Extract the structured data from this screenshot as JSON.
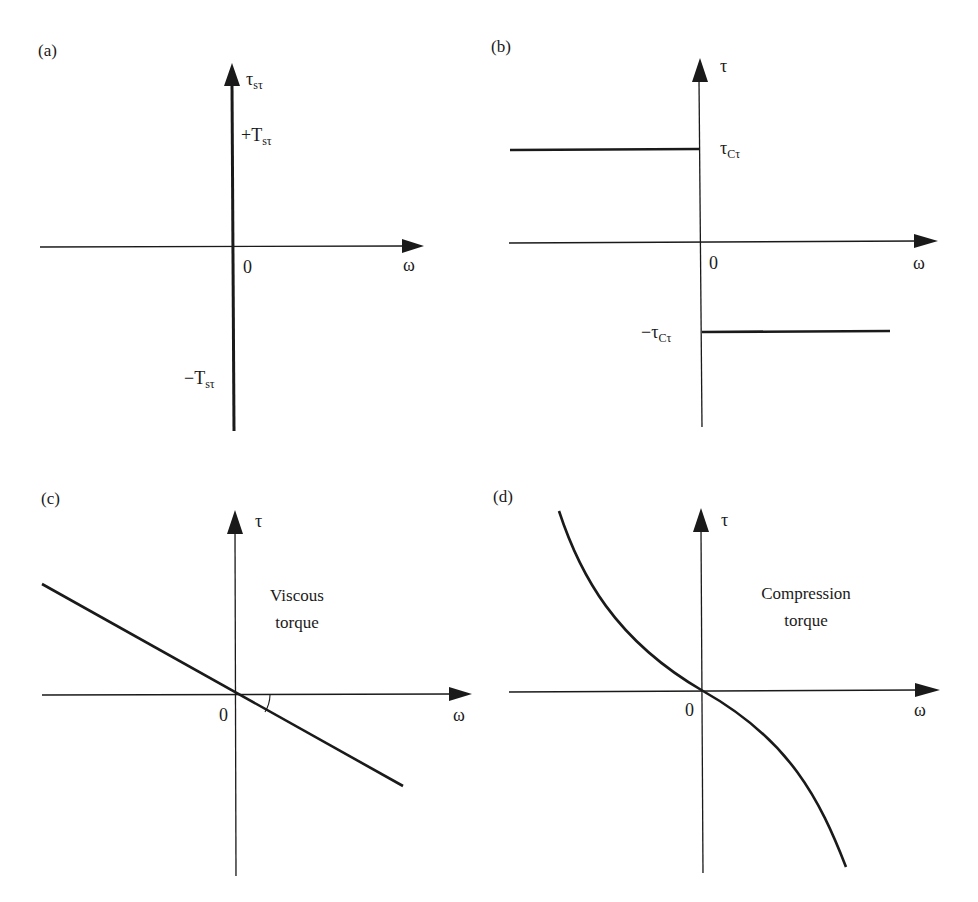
{
  "figure": {
    "panels": [
      {
        "id": "a",
        "label": "(a)",
        "y_axis_label": "τ",
        "y_axis_sub": "sτ",
        "x_axis_label": "ω",
        "origin_label": "0",
        "upper_level_label": "+T",
        "upper_level_sub": "sτ",
        "lower_level_label": "−T",
        "lower_level_sub": "sτ",
        "description": "Static friction torque: vertical segment along τ-axis at ω = 0 between −Tsτ and +Tsτ"
      },
      {
        "id": "b",
        "label": "(b)",
        "y_axis_label": "τ",
        "x_axis_label": "ω",
        "origin_label": "0",
        "upper_level_label": "τ",
        "upper_level_sub": "Cτ",
        "lower_level_label": "−τ",
        "lower_level_sub": "Cτ",
        "description": "Coulomb friction: +τCτ for ω < 0, −τCτ for ω > 0"
      },
      {
        "id": "c",
        "label": "(c)",
        "y_axis_label": "τ",
        "x_axis_label": "ω",
        "origin_label": "0",
        "annotation_line1": "Viscous",
        "annotation_line2": "torque",
        "description": "Straight line through origin with negative slope; small angle arc at origin"
      },
      {
        "id": "d",
        "label": "(d)",
        "y_axis_label": "τ",
        "x_axis_label": "ω",
        "origin_label": "0",
        "annotation_line1": "Compression",
        "annotation_line2": "torque",
        "description": "Odd nonlinear decreasing curve through origin, steepening away from zero"
      }
    ]
  },
  "colors": {
    "ink": "#1a1a1a",
    "background": "#ffffff"
  }
}
